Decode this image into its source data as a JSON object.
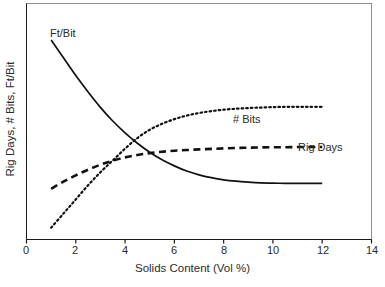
{
  "chart_data": {
    "type": "line",
    "title": "",
    "subtitle": "",
    "xlabel": "Solids Content (Vol %)",
    "ylabel": "Rig Days, # Bits, Ft/Bit",
    "xlim": [
      0,
      14
    ],
    "ylim": [
      0,
      100
    ],
    "xticks": [
      0,
      2,
      4,
      6,
      8,
      10,
      12,
      14
    ],
    "xticklabels": [
      "0",
      "2",
      "4",
      "6",
      "8",
      "10",
      "12",
      "14"
    ],
    "yticks": [],
    "yticklabels": [],
    "grid": false,
    "legend_position": "inline-annotations",
    "annotations": [
      {
        "text": "Ft/Bit",
        "x": 1.1,
        "y": 91
      },
      {
        "text": "# Bits",
        "x": 8.4,
        "y": 54
      },
      {
        "text": "Rig Days",
        "x": 11.4,
        "y": 42
      }
    ],
    "x": [
      1,
      1.5,
      2,
      2.5,
      3,
      3.5,
      4,
      4.5,
      5,
      5.5,
      6,
      6.5,
      7,
      7.5,
      8,
      8.5,
      9,
      9.5,
      10,
      10.5,
      11,
      11.5,
      12
    ],
    "series": [
      {
        "name": "Ft/Bit",
        "style": "solid",
        "color": "#111111",
        "values": [
          84.5,
          77.0,
          69.5,
          62.5,
          56.0,
          50.2,
          45.2,
          40.8,
          37.0,
          33.8,
          31.2,
          29.0,
          27.4,
          26.2,
          25.3,
          24.7,
          24.3,
          24.0,
          23.9,
          23.8,
          23.8,
          23.8,
          23.8
        ]
      },
      {
        "name": "# Bits",
        "style": "dotted",
        "color": "#111111",
        "values": [
          5.0,
          11.0,
          17.0,
          23.0,
          28.5,
          33.5,
          38.5,
          43.0,
          46.5,
          49.0,
          51.0,
          52.5,
          53.6,
          54.4,
          55.0,
          55.4,
          55.7,
          55.9,
          56.1,
          56.2,
          56.2,
          56.2,
          56.2
        ]
      },
      {
        "name": "Rig Days",
        "style": "dashed",
        "color": "#111111",
        "values": [
          21.5,
          24.5,
          27.2,
          29.6,
          31.7,
          33.4,
          34.8,
          35.8,
          36.6,
          37.2,
          37.6,
          37.9,
          38.2,
          38.4,
          38.6,
          38.8,
          38.9,
          39.0,
          39.1,
          39.1,
          39.2,
          39.2,
          39.2
        ]
      }
    ]
  },
  "axis": {
    "x_title": "Solids Content (Vol %)",
    "y_title": "Rig Days, # Bits, Ft/Bit",
    "x_tick_labels": [
      "0",
      "2",
      "4",
      "6",
      "8",
      "10",
      "12",
      "14"
    ]
  },
  "labels": {
    "ftbit": "Ft/Bit",
    "bits": "# Bits",
    "rigdays": "Rig Days"
  },
  "colors": {
    "line": "#111111",
    "axis": "#1a1a1a",
    "frame_light": "#8f8f8f",
    "text": "#2b2b2b",
    "background": "#ffffff"
  }
}
